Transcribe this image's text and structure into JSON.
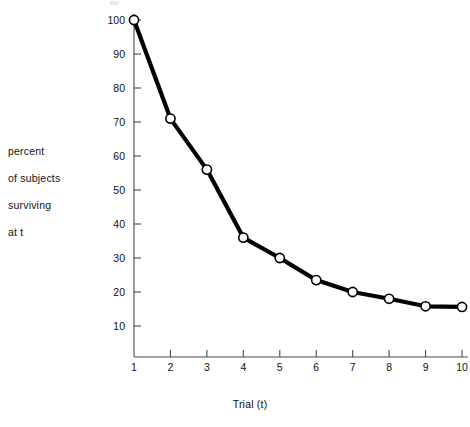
{
  "chart_data": {
    "type": "line",
    "title": "",
    "xlabel": "Trial (t)",
    "ylabel": "percent of subjects surviving at t",
    "ylabel_lines": [
      "percent",
      "of subjects",
      "surviving",
      "at t"
    ],
    "x": [
      1,
      2,
      3,
      4,
      5,
      6,
      7,
      8,
      9,
      10
    ],
    "values": [
      100,
      71,
      56,
      36,
      30,
      23.5,
      20,
      18,
      15.8,
      15.6
    ],
    "series": [
      {
        "name": "percent surviving",
        "values": [
          100,
          71,
          56,
          36,
          30,
          23.5,
          20,
          18,
          15.8,
          15.6
        ]
      }
    ],
    "xlim": [
      1,
      10
    ],
    "ylim": [
      6,
      103
    ],
    "xticks": [
      1,
      2,
      3,
      4,
      5,
      6,
      7,
      8,
      9,
      10
    ],
    "xtick_labels": [
      "1",
      "2",
      "3",
      "4",
      "5",
      "6",
      "7",
      "8",
      "9",
      "10"
    ],
    "yticks": [
      10,
      20,
      30,
      40,
      50,
      60,
      70,
      80,
      90,
      100
    ],
    "ytick_labels": [
      "10",
      "20",
      "30",
      "40",
      "50",
      "60",
      "70",
      "80",
      "90",
      "100"
    ],
    "grid": false,
    "legend": false,
    "legend_position": "none",
    "marker": "open-circle",
    "line_color": "#000000",
    "marker_fill": "#ffffff",
    "marker_stroke": "#000000",
    "axis_color": "#4a4a4a",
    "background": "#ffffff"
  }
}
